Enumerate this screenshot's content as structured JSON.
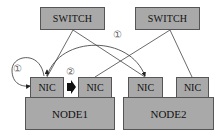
{
  "diagram": {
    "switches": [
      {
        "id": "switch1",
        "label": "SWITCH"
      },
      {
        "id": "switch2",
        "label": "SWITCH"
      }
    ],
    "nodes": [
      {
        "id": "node1",
        "label": "NODE1",
        "nics": [
          {
            "label": "NIC"
          },
          {
            "label": "NIC"
          }
        ]
      },
      {
        "id": "node2",
        "label": "NODE2",
        "nics": [
          {
            "label": "NIC"
          },
          {
            "label": "NIC"
          }
        ]
      }
    ],
    "annotations": {
      "step1_left": "①",
      "step1_top": "①",
      "step2": "②"
    },
    "colors": {
      "box_fill": "#a9a9a9",
      "border": "#555555",
      "line": "#444444",
      "arrow": "#111111"
    }
  }
}
